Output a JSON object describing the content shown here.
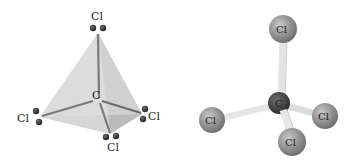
{
  "figure": {
    "molecule": "CCl4",
    "left_model": {
      "type": "tetrahedral-wedge",
      "central_atom": "C",
      "atoms": [
        {
          "id": "cl-top",
          "label": "Cl"
        },
        {
          "id": "cl-left",
          "label": "Cl"
        },
        {
          "id": "cl-right",
          "label": "Cl"
        },
        {
          "id": "cl-bottom",
          "label": "Cl"
        }
      ]
    },
    "right_model": {
      "type": "ball-and-stick",
      "central_atom": "C",
      "atoms": [
        {
          "id": "cl-top",
          "label": "Cl"
        },
        {
          "id": "cl-left",
          "label": "Cl"
        },
        {
          "id": "cl-right",
          "label": "Cl"
        },
        {
          "id": "cl-bottom",
          "label": "Cl"
        }
      ]
    },
    "colors": {
      "face_light": "#d9d9d9",
      "face_mid": "#c4c4c4",
      "face_dark": "#a9a9a9",
      "bond_line": "#7a7a7a",
      "lone_pair_dot": "#3a3a3a",
      "cl_sphere": "#8f8f8f",
      "c_sphere": "#3d3d3d",
      "stick": "#e6e6e6"
    }
  }
}
